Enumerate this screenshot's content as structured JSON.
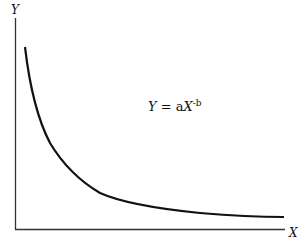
{
  "diagram": {
    "y_axis_label": "Y",
    "x_axis_label": "X",
    "equation": {
      "lhs": "Y",
      "eq": " = a",
      "var": "X",
      "exponent": "-b"
    },
    "curve_color": "#111111",
    "axis_color": "#333333"
  }
}
